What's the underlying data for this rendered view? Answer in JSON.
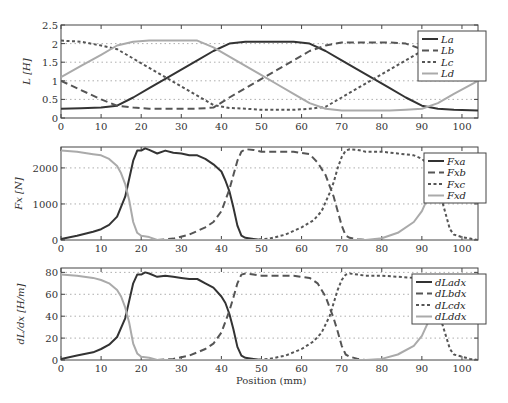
{
  "figure": {
    "xlabel": "Position (mm)",
    "x_ticks": [
      "0",
      "10",
      "20",
      "30",
      "40",
      "50",
      "60",
      "70",
      "80",
      "90",
      "100"
    ]
  },
  "chart_data": [
    {
      "type": "line",
      "title": "",
      "xlabel": "",
      "ylabel": "L [H]",
      "xlim": [
        0,
        104
      ],
      "ylim": [
        0,
        2.5
      ],
      "y_ticks": [
        "0",
        "0.5",
        "1",
        "1.5",
        "2",
        "2.5"
      ],
      "grid": "horizontal dotted",
      "legend_position": "upper right",
      "x": [
        0,
        5,
        10,
        14,
        18,
        22,
        26,
        30,
        34,
        38,
        42,
        46,
        50,
        54,
        58,
        62,
        66,
        70,
        74,
        78,
        82,
        86,
        90,
        94,
        98,
        104
      ],
      "series": [
        {
          "name": "La",
          "style": "solid dark",
          "values": [
            0.25,
            0.26,
            0.28,
            0.33,
            0.55,
            0.8,
            1.05,
            1.3,
            1.55,
            1.8,
            2.0,
            2.05,
            2.05,
            2.05,
            2.05,
            2.0,
            1.8,
            1.55,
            1.3,
            1.05,
            0.8,
            0.55,
            0.33,
            0.25,
            0.22,
            0.2
          ]
        },
        {
          "name": "Lb",
          "style": "dashed",
          "values": [
            1.0,
            0.75,
            0.5,
            0.33,
            0.28,
            0.25,
            0.25,
            0.25,
            0.25,
            0.28,
            0.55,
            0.8,
            1.05,
            1.3,
            1.55,
            1.8,
            1.95,
            2.03,
            2.03,
            2.03,
            2.03,
            2.0,
            1.85,
            1.55,
            1.3,
            1.0
          ]
        },
        {
          "name": "Lc",
          "style": "dotted",
          "values": [
            2.08,
            2.05,
            1.95,
            1.85,
            1.6,
            1.35,
            1.1,
            0.85,
            0.6,
            0.35,
            0.27,
            0.25,
            0.22,
            0.22,
            0.22,
            0.25,
            0.3,
            0.55,
            0.8,
            1.05,
            1.3,
            1.55,
            1.8,
            2.0,
            2.05,
            2.08
          ]
        },
        {
          "name": "Ld",
          "style": "solid light",
          "values": [
            1.1,
            1.4,
            1.7,
            1.95,
            2.05,
            2.08,
            2.08,
            2.08,
            2.08,
            1.9,
            1.65,
            1.4,
            1.15,
            0.9,
            0.65,
            0.4,
            0.25,
            0.2,
            0.2,
            0.2,
            0.2,
            0.22,
            0.25,
            0.4,
            0.65,
            1.0
          ]
        }
      ]
    },
    {
      "type": "line",
      "title": "",
      "xlabel": "",
      "ylabel": "Fx [N]",
      "xlim": [
        0,
        104
      ],
      "ylim": [
        0,
        2580
      ],
      "y_ticks": [
        "0",
        "1000",
        "2000"
      ],
      "grid": "horizontal dotted",
      "legend_position": "upper right",
      "x": [
        0,
        4,
        8,
        10,
        12,
        14,
        16,
        18,
        19,
        20,
        21,
        22,
        24,
        26,
        28,
        30,
        32,
        34,
        36,
        38,
        40,
        41,
        42,
        43,
        44,
        45,
        46,
        48,
        50,
        52
      ],
      "series": [
        {
          "name": "Fxa",
          "style": "solid dark",
          "values": [
            30,
            120,
            230,
            300,
            420,
            650,
            1200,
            2200,
            2480,
            2480,
            2540,
            2500,
            2400,
            2480,
            2420,
            2400,
            2350,
            2350,
            2250,
            2100,
            1900,
            1650,
            1350,
            900,
            400,
            120,
            60,
            30,
            0,
            0
          ]
        },
        {
          "name": "Fxb",
          "style": "dashed",
          "x": [
            24,
            28,
            32,
            36,
            38,
            40,
            41,
            42,
            43,
            44,
            45,
            46,
            48,
            50,
            54,
            58,
            62,
            64,
            66,
            67,
            68,
            69,
            70,
            71,
            72,
            74,
            76
          ],
          "values": [
            0,
            40,
            150,
            350,
            500,
            800,
            1100,
            1400,
            1800,
            2200,
            2450,
            2520,
            2500,
            2450,
            2450,
            2450,
            2380,
            2150,
            1800,
            1500,
            1200,
            800,
            400,
            120,
            60,
            20,
            0
          ]
        },
        {
          "name": "Fxc",
          "style": "dotted",
          "x": [
            48,
            52,
            56,
            60,
            63,
            65,
            67,
            68,
            69,
            70,
            71,
            72,
            74,
            76,
            80,
            84,
            88,
            90,
            92,
            93,
            94,
            95,
            96,
            97,
            98,
            100,
            102,
            104
          ],
          "values": [
            0,
            40,
            150,
            350,
            550,
            800,
            1300,
            1600,
            2000,
            2300,
            2480,
            2520,
            2500,
            2450,
            2450,
            2400,
            2350,
            2250,
            2050,
            1800,
            1500,
            1100,
            700,
            300,
            150,
            80,
            40,
            0
          ]
        },
        {
          "name": "Fxd",
          "style": "solid light",
          "x": [
            0,
            4,
            8,
            10,
            12,
            14,
            15,
            16,
            17,
            18,
            19,
            20,
            22,
            24,
            76,
            80,
            84,
            88,
            90,
            92,
            93,
            94
          ],
          "values": [
            2480,
            2450,
            2380,
            2350,
            2250,
            2050,
            1850,
            1550,
            1100,
            500,
            200,
            120,
            80,
            0,
            0,
            50,
            200,
            500,
            800,
            1300,
            1700,
            2200
          ]
        }
      ]
    },
    {
      "type": "line",
      "title": "",
      "xlabel": "Position (mm)",
      "ylabel": "dL/dx [H/m]",
      "xlim": [
        0,
        104
      ],
      "ylim": [
        0,
        84
      ],
      "y_ticks": [
        "0",
        "20",
        "40",
        "60",
        "80"
      ],
      "grid": "horizontal dotted",
      "legend_position": "upper right",
      "series": [
        {
          "name": "dLadx",
          "style": "solid dark",
          "x": [
            0,
            4,
            8,
            10,
            12,
            14,
            16,
            18,
            19,
            20,
            21,
            22,
            24,
            26,
            28,
            30,
            32,
            34,
            36,
            38,
            40,
            41,
            42,
            43,
            44,
            45,
            46,
            48,
            50,
            52
          ],
          "values": [
            1,
            4,
            7,
            10,
            14,
            21,
            38,
            70,
            78,
            78,
            80,
            79,
            76,
            77,
            76,
            75,
            74,
            74,
            70,
            66,
            58,
            52,
            42,
            28,
            12,
            4,
            2,
            1,
            0,
            0
          ]
        },
        {
          "name": "dLbdx",
          "style": "dashed",
          "x": [
            24,
            28,
            32,
            36,
            38,
            40,
            41,
            42,
            43,
            44,
            45,
            46,
            48,
            50,
            54,
            58,
            62,
            64,
            66,
            67,
            68,
            69,
            70,
            71,
            72,
            74,
            76
          ],
          "values": [
            0,
            1,
            4,
            10,
            15,
            25,
            35,
            45,
            57,
            70,
            78,
            79,
            78,
            77,
            77,
            77,
            75,
            70,
            58,
            48,
            38,
            26,
            13,
            5,
            3,
            1,
            0
          ]
        },
        {
          "name": "dLcdx",
          "style": "dotted",
          "x": [
            48,
            52,
            56,
            60,
            63,
            65,
            67,
            68,
            69,
            70,
            71,
            72,
            74,
            76,
            80,
            84,
            88,
            90,
            92,
            93,
            94,
            95,
            96,
            97,
            98,
            100,
            102,
            104
          ],
          "values": [
            0,
            1,
            4,
            10,
            17,
            25,
            40,
            52,
            64,
            73,
            78,
            79,
            78,
            77,
            77,
            76,
            75,
            72,
            65,
            56,
            46,
            34,
            22,
            10,
            5,
            3,
            1,
            0
          ]
        },
        {
          "name": "dLddx",
          "style": "solid light",
          "x": [
            0,
            4,
            8,
            10,
            12,
            14,
            15,
            16,
            17,
            18,
            19,
            20,
            22,
            24,
            76,
            80,
            84,
            88,
            90,
            92,
            93,
            94
          ],
          "values": [
            78,
            77,
            75,
            73,
            70,
            64,
            58,
            48,
            34,
            15,
            6,
            3,
            2,
            0,
            0,
            1,
            5,
            13,
            22,
            38,
            52,
            66
          ]
        }
      ]
    }
  ]
}
